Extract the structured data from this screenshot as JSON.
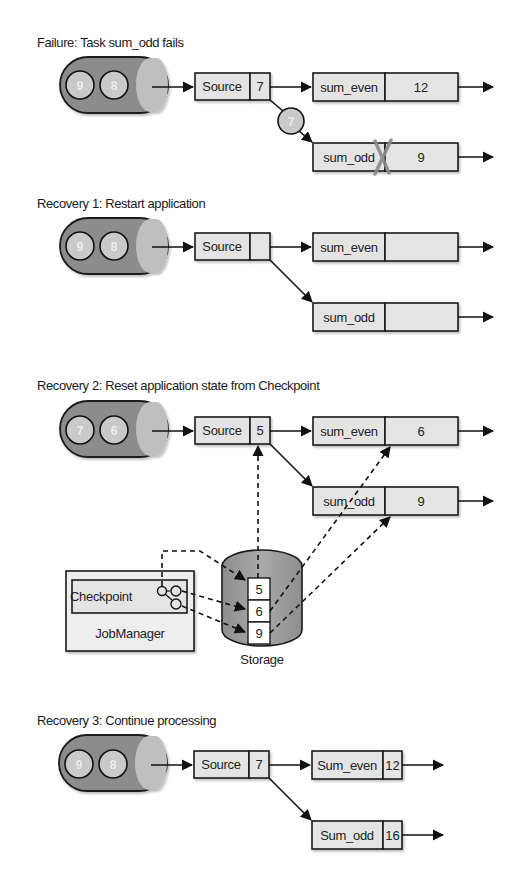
{
  "colors": {
    "queue_body": "#8c8c8c",
    "queue_face": "#bfbfbf",
    "queue_item": "#c9c9c9",
    "box_fill": "#e4e4e4",
    "storage_fill": "#9a9a9a",
    "stroke": "#1a1a1a",
    "failure_mark": "#8a8a8a"
  },
  "panels": [
    {
      "title": "Failure: Task sum_odd fails",
      "queue_items": [
        "9",
        "8"
      ],
      "source": {
        "label": "Source",
        "value": "7"
      },
      "in_flight_record": "7",
      "sum_even": {
        "label": "sum_even",
        "value": "12"
      },
      "sum_odd": {
        "label": "sum_odd",
        "value": "9",
        "failed": true
      }
    },
    {
      "title": "Recovery 1: Restart application",
      "queue_items": [
        "9",
        "8"
      ],
      "source": {
        "label": "Source",
        "value": ""
      },
      "sum_even": {
        "label": "sum_even",
        "value": ""
      },
      "sum_odd": {
        "label": "sum_odd",
        "value": ""
      }
    },
    {
      "title": "Recovery 2: Reset application state from Checkpoint",
      "queue_items": [
        "7",
        "6"
      ],
      "source": {
        "label": "Source",
        "value": "5"
      },
      "sum_even": {
        "label": "sum_even",
        "value": "6"
      },
      "sum_odd": {
        "label": "sum_odd",
        "value": "9"
      },
      "jobmanager": {
        "label": "JobManager",
        "checkpoint_label": "Checkpoint"
      },
      "storage": {
        "label": "Storage",
        "cells": [
          "5",
          "6",
          "9"
        ]
      }
    },
    {
      "title": "Recovery 3: Continue processing",
      "queue_items": [
        "9",
        "8"
      ],
      "source": {
        "label": "Source",
        "value": "7"
      },
      "sum_even": {
        "label": "Sum_even",
        "value": "12"
      },
      "sum_odd": {
        "label": "Sum_odd",
        "value": "16"
      }
    }
  ]
}
